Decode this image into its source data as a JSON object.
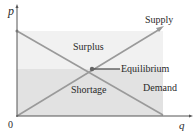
{
  "diagram": {
    "axes": {
      "y_label": "p",
      "x_label": "q",
      "origin_label": "0"
    },
    "curves": {
      "supply_label": "Supply",
      "demand_label": "Demand"
    },
    "regions": {
      "surplus_label": "Surplus",
      "shortage_label": "Shortage"
    },
    "equilibrium_label": "Equilibrium",
    "colors": {
      "surplus_fill": "#f1f1f1",
      "shortage_fill": "#e2e2e2",
      "curve": "#9a9a9a",
      "axis": "#555555",
      "equilibrium_line": "#444444",
      "text": "#2a2a2a"
    }
  }
}
